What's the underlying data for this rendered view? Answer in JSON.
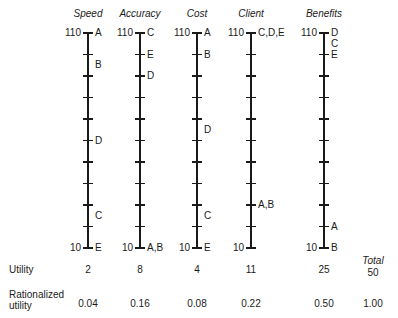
{
  "chart_data": {
    "type": "table",
    "title": "",
    "scale": {
      "min": 10,
      "max": 110,
      "tick_step": 10,
      "top_label": "110",
      "bottom_label": "10"
    },
    "criteria": [
      {
        "name": "Speed",
        "x": 88,
        "alternatives": [
          {
            "label": "A",
            "value": 110
          },
          {
            "label": "B",
            "value": 95
          },
          {
            "label": "D",
            "value": 60
          },
          {
            "label": "C",
            "value": 25
          },
          {
            "label": "E",
            "value": 10
          }
        ],
        "utility": "2",
        "rationalized": "0.04"
      },
      {
        "name": "Accuracy",
        "x": 140,
        "alternatives": [
          {
            "label": "C",
            "value": 110
          },
          {
            "label": "E",
            "value": 100
          },
          {
            "label": "D",
            "value": 90
          },
          {
            "label": "A,B",
            "value": 10
          }
        ],
        "utility": "8",
        "rationalized": "0.16"
      },
      {
        "name": "Cost",
        "x": 197,
        "alternatives": [
          {
            "label": "A",
            "value": 110
          },
          {
            "label": "B",
            "value": 100
          },
          {
            "label": "D",
            "value": 65
          },
          {
            "label": "C",
            "value": 25
          },
          {
            "label": "E",
            "value": 10
          }
        ],
        "utility": "4",
        "rationalized": "0.08"
      },
      {
        "name": "Client",
        "x": 251,
        "alternatives": [
          {
            "label": "C,D,E",
            "value": 110
          },
          {
            "label": "A,B",
            "value": 30
          }
        ],
        "utility": "11",
        "rationalized": "0.22"
      },
      {
        "name": "Benefits",
        "x": 324,
        "alternatives": [
          {
            "label": "D",
            "value": 110
          },
          {
            "label": "C",
            "value": 105
          },
          {
            "label": "E",
            "value": 100
          },
          {
            "label": "A",
            "value": 20
          },
          {
            "label": "B",
            "value": 10
          }
        ],
        "utility": "25",
        "rationalized": "0.50"
      }
    ],
    "rows": {
      "utility_label": "Utility",
      "rationalized_label_1": "Rationalized",
      "rationalized_label_2": "utility"
    },
    "total": {
      "label": "Total",
      "utility": "50",
      "rationalized": "1.00"
    }
  }
}
